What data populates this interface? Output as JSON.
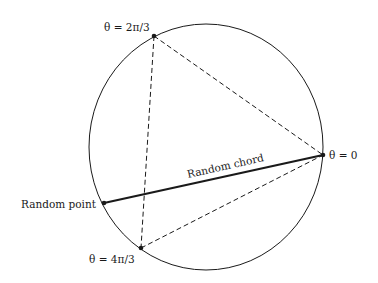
{
  "diagram": {
    "colors": {
      "background": "#ffffff",
      "ink": "#1a1a1a"
    },
    "circle": {
      "cx": 206,
      "cy": 147,
      "rx": 117,
      "ry": 123
    },
    "points": {
      "theta_0": {
        "x": 323,
        "y": 155,
        "label": "θ = 0"
      },
      "theta_2pi3": {
        "x": 154,
        "y": 36,
        "label": "θ = 2π/3"
      },
      "theta_4pi3": {
        "x": 141,
        "y": 248,
        "label": "θ = 4π/3"
      },
      "random_point": {
        "x": 104,
        "y": 203,
        "label": "Random point"
      }
    },
    "chord_label": "Random chord",
    "triangle_style": "dashed",
    "chord_style": "solid-thick"
  }
}
